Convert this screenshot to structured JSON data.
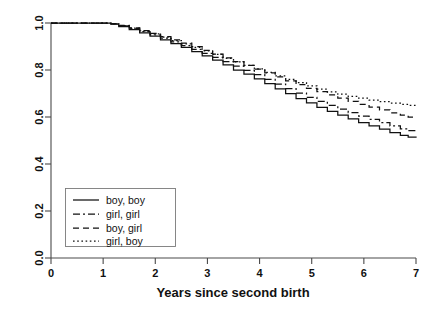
{
  "chart_data": {
    "type": "line",
    "title": "",
    "subtitle": "",
    "xlabel": "Years since second birth",
    "ylabel": "",
    "xlim": [
      0,
      7
    ],
    "ylim": [
      0,
      1
    ],
    "grid": false,
    "legend_position": "bottom-left",
    "xticks": [
      "0",
      "1",
      "2",
      "3",
      "4",
      "5",
      "6",
      "7"
    ],
    "xtick_values": [
      0,
      1,
      2,
      3,
      4,
      5,
      6,
      7
    ],
    "yticks": [
      "0.0",
      "0.2",
      "0.4",
      "0.6",
      "0.8",
      "1.0"
    ],
    "ytick_values": [
      0.0,
      0.2,
      0.4,
      0.6,
      0.8,
      1.0
    ],
    "series": [
      {
        "name": "boy, boy",
        "style": "solid",
        "dasharray": "none",
        "color": "#111111",
        "x": [
          0,
          0.5,
          1.0,
          1.15,
          1.3,
          1.5,
          1.7,
          1.9,
          2.1,
          2.3,
          2.5,
          2.7,
          2.9,
          3.1,
          3.3,
          3.5,
          3.7,
          3.9,
          4.1,
          4.3,
          4.5,
          4.7,
          4.9,
          5.1,
          5.3,
          5.5,
          5.7,
          5.9,
          6.1,
          6.3,
          6.5,
          6.7,
          6.85,
          7.0
        ],
        "y": [
          1.0,
          1.0,
          1.0,
          0.995,
          0.985,
          0.972,
          0.958,
          0.944,
          0.928,
          0.912,
          0.896,
          0.878,
          0.86,
          0.842,
          0.822,
          0.8,
          0.782,
          0.762,
          0.742,
          0.72,
          0.7,
          0.678,
          0.66,
          0.641,
          0.624,
          0.608,
          0.592,
          0.576,
          0.562,
          0.548,
          0.534,
          0.522,
          0.514,
          0.512
        ]
      },
      {
        "name": "girl, girl",
        "style": "dashdot",
        "dasharray": "7,3,2,3",
        "color": "#111111",
        "x": [
          0,
          0.5,
          1.0,
          1.15,
          1.3,
          1.5,
          1.7,
          1.9,
          2.1,
          2.3,
          2.5,
          2.7,
          2.9,
          3.1,
          3.3,
          3.5,
          3.7,
          3.9,
          4.1,
          4.3,
          4.5,
          4.7,
          4.9,
          5.1,
          5.3,
          5.5,
          5.7,
          5.9,
          6.1,
          6.3,
          6.5,
          6.7,
          6.85,
          7.0
        ],
        "y": [
          1.0,
          1.0,
          1.0,
          0.996,
          0.988,
          0.976,
          0.963,
          0.95,
          0.936,
          0.92,
          0.904,
          0.888,
          0.871,
          0.854,
          0.836,
          0.816,
          0.798,
          0.78,
          0.76,
          0.74,
          0.721,
          0.702,
          0.684,
          0.667,
          0.65,
          0.634,
          0.619,
          0.604,
          0.59,
          0.576,
          0.562,
          0.55,
          0.542,
          0.538
        ]
      },
      {
        "name": "boy, girl",
        "style": "dashed",
        "dasharray": "6,4",
        "color": "#111111",
        "x": [
          0,
          0.5,
          1.0,
          1.15,
          1.3,
          1.5,
          1.7,
          1.9,
          2.1,
          2.3,
          2.5,
          2.7,
          2.9,
          3.1,
          3.3,
          3.5,
          3.7,
          3.9,
          4.1,
          4.3,
          4.5,
          4.7,
          4.9,
          5.1,
          5.3,
          5.5,
          5.7,
          5.9,
          6.1,
          6.3,
          6.5,
          6.7,
          6.85,
          7.0
        ],
        "y": [
          1.0,
          1.0,
          1.0,
          0.997,
          0.99,
          0.979,
          0.968,
          0.956,
          0.942,
          0.928,
          0.914,
          0.899,
          0.884,
          0.868,
          0.852,
          0.836,
          0.82,
          0.804,
          0.788,
          0.771,
          0.754,
          0.738,
          0.722,
          0.708,
          0.694,
          0.68,
          0.667,
          0.654,
          0.642,
          0.63,
          0.618,
          0.608,
          0.6,
          0.596
        ]
      },
      {
        "name": "girl, boy",
        "style": "dotted",
        "dasharray": "1.6,2.6",
        "color": "#111111",
        "x": [
          0,
          0.5,
          1.0,
          1.15,
          1.3,
          1.5,
          1.7,
          1.9,
          2.1,
          2.3,
          2.5,
          2.7,
          2.9,
          3.1,
          3.3,
          3.5,
          3.7,
          3.9,
          4.1,
          4.3,
          4.5,
          4.7,
          4.9,
          5.1,
          5.3,
          5.5,
          5.7,
          5.9,
          6.1,
          6.3,
          6.5,
          6.7,
          6.85,
          7.0
        ],
        "y": [
          1.0,
          1.0,
          1.0,
          0.996,
          0.989,
          0.978,
          0.966,
          0.954,
          0.94,
          0.925,
          0.911,
          0.896,
          0.881,
          0.866,
          0.85,
          0.835,
          0.82,
          0.805,
          0.79,
          0.775,
          0.76,
          0.746,
          0.732,
          0.719,
          0.707,
          0.697,
          0.688,
          0.68,
          0.672,
          0.665,
          0.659,
          0.654,
          0.65,
          0.648
        ]
      }
    ]
  },
  "legend": {
    "items": [
      {
        "label": "boy, boy"
      },
      {
        "label": "girl, girl"
      },
      {
        "label": "boy, girl"
      },
      {
        "label": "girl, boy"
      }
    ]
  }
}
